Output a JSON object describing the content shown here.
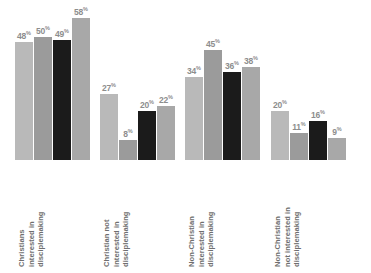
{
  "chart_data": {
    "type": "bar",
    "title": "",
    "subtitle": "",
    "xlabel": "",
    "ylabel": "",
    "ylim": [
      0,
      62
    ],
    "grid": false,
    "legend": "none",
    "value_suffix": "%",
    "categories": [
      "Christians interested in disciplemaking",
      "Christian not interested in disciplemaking",
      "Non-Christian interested in disciplemaking",
      "Non-Christian not interested in disciplemaking"
    ],
    "category_lines": [
      [
        "Christians",
        "interested in",
        "disciplemaking"
      ],
      [
        "Christian not",
        "interested in",
        "disciplemaking"
      ],
      [
        "Non-Christian",
        "interested in",
        "disciplemaking"
      ],
      [
        "Non-Christian",
        "not interested in",
        "disciplemaking"
      ]
    ],
    "series": [
      {
        "name": "series-1",
        "color": "#b9b9b9",
        "values": [
          48,
          27,
          34,
          20
        ]
      },
      {
        "name": "series-2",
        "color": "#9b9b9b",
        "values": [
          50,
          8,
          45,
          11
        ]
      },
      {
        "name": "series-3",
        "color": "#1b1b1b",
        "values": [
          49,
          20,
          36,
          16
        ]
      },
      {
        "name": "series-4",
        "color": "#a8a8a8",
        "values": [
          58,
          22,
          38,
          9
        ]
      }
    ],
    "groups": [
      {
        "category": "Christians interested in disciplemaking",
        "bars": [
          {
            "value": 48,
            "label": "48",
            "suffix": "%",
            "color": "#b9b9b9"
          },
          {
            "value": 50,
            "label": "50",
            "suffix": "%",
            "color": "#9b9b9b"
          },
          {
            "value": 49,
            "label": "49",
            "suffix": "%",
            "color": "#1b1b1b"
          },
          {
            "value": 58,
            "label": "58",
            "suffix": "%",
            "color": "#a8a8a8"
          }
        ]
      },
      {
        "category": "Christian not interested in disciplemaking",
        "bars": [
          {
            "value": 27,
            "label": "27",
            "suffix": "%",
            "color": "#b9b9b9"
          },
          {
            "value": 8,
            "label": "8",
            "suffix": "%",
            "color": "#9b9b9b"
          },
          {
            "value": 20,
            "label": "20",
            "suffix": "%",
            "color": "#1b1b1b"
          },
          {
            "value": 22,
            "label": "22",
            "suffix": "%",
            "color": "#a8a8a8"
          }
        ]
      },
      {
        "category": "Non-Christian interested in disciplemaking",
        "bars": [
          {
            "value": 34,
            "label": "34",
            "suffix": "%",
            "color": "#b9b9b9"
          },
          {
            "value": 45,
            "label": "45",
            "suffix": "%",
            "color": "#9b9b9b"
          },
          {
            "value": 36,
            "label": "36",
            "suffix": "%",
            "color": "#1b1b1b"
          },
          {
            "value": 38,
            "label": "38",
            "suffix": "%",
            "color": "#a8a8a8"
          }
        ]
      },
      {
        "category": "Non-Christian not interested in disciplemaking",
        "bars": [
          {
            "value": 20,
            "label": "20",
            "suffix": "%",
            "color": "#b9b9b9"
          },
          {
            "value": 11,
            "label": "11",
            "suffix": "%",
            "color": "#9b9b9b"
          },
          {
            "value": 16,
            "label": "16",
            "suffix": "%",
            "color": "#1b1b1b"
          },
          {
            "value": 9,
            "label": "9",
            "suffix": "%",
            "color": "#a8a8a8"
          }
        ]
      }
    ]
  },
  "style": {
    "background": "#ffffff",
    "label_color": "#8d8d8d",
    "category_color": "#6f6f6f"
  },
  "layout": {
    "group_lefts": [
      15,
      100,
      185,
      271
    ],
    "group_width": 75,
    "baseline_y": 159,
    "max_value": 62,
    "plot_height": 152
  }
}
